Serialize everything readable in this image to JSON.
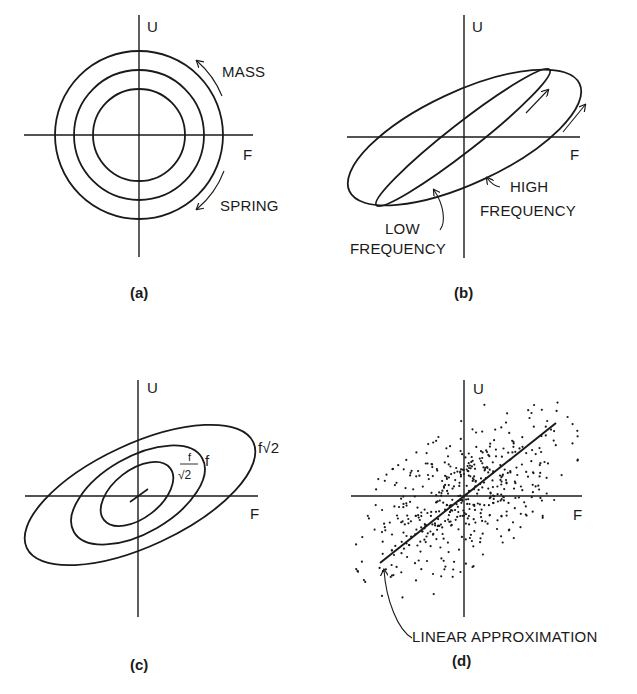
{
  "figure": {
    "ink_color": "#1a1a1a",
    "background": "#ffffff",
    "panels": {
      "a": {
        "caption": "(a)",
        "axis_x_label": "F",
        "axis_y_label": "U",
        "annotations": {
          "mass": "MASS",
          "spring": "SPRING"
        },
        "circle_radii": [
          46,
          65,
          84
        ]
      },
      "b": {
        "caption": "(b)",
        "axis_x_label": "F",
        "axis_y_label": "U",
        "annotations": {
          "high_line1": "HIGH",
          "high_line2": "FREQUENCY",
          "low_line1": "LOW",
          "low_line2": "FREQUENCY"
        }
      },
      "c": {
        "caption": "(c)",
        "axis_x_label": "F",
        "axis_y_label": "U",
        "contour_labels": {
          "outer": "f√2",
          "middle": "f",
          "inner_numerator": "f",
          "inner_denominator": "√2"
        }
      },
      "d": {
        "caption": "(d)",
        "axis_x_label": "F",
        "axis_y_label": "U",
        "annotations": {
          "linear": "LINEAR APPROXIMATION"
        },
        "scatter": {
          "count": 520,
          "seed": 7,
          "angle_deg": -35,
          "sx": 62,
          "sy": 30
        }
      }
    }
  }
}
